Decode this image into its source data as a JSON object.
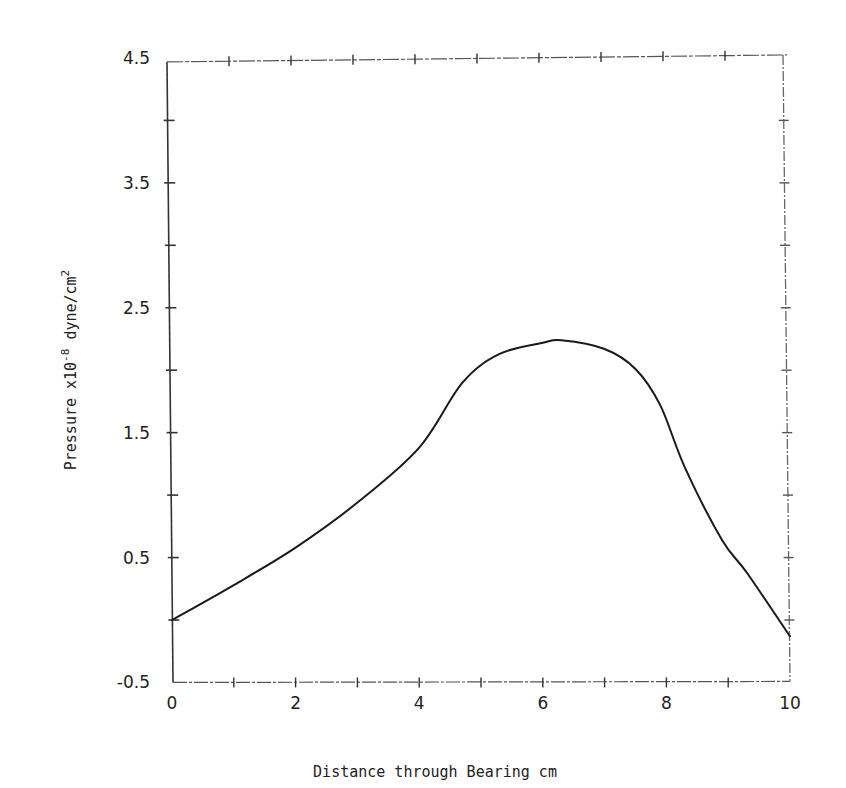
{
  "chart_data": {
    "type": "line",
    "title": "",
    "xlabel": "Distance through Bearing cm",
    "ylabel": "Pressure x10",
    "ylabel_exp": "-8",
    "ylabel_unit": " dyne/cm",
    "ylabel_unit_exp": "2",
    "xlim": [
      0,
      10
    ],
    "ylim": [
      -0.5,
      4.5
    ],
    "grid": false,
    "legend": null,
    "x_ticks": [
      0,
      2,
      4,
      6,
      8,
      10
    ],
    "x_tick_labels": [
      "0",
      "2",
      "4",
      "6",
      "8",
      "10"
    ],
    "x_minor_ticks": [
      1,
      3,
      5,
      7,
      9
    ],
    "y_ticks": [
      -0.5,
      0.5,
      1.5,
      2.5,
      3.5,
      4.5
    ],
    "y_tick_labels": [
      "-0.5",
      "0.5",
      "1.5",
      "2.5",
      "3.5",
      "4.5"
    ],
    "y_minor_ticks": [
      0,
      1,
      2,
      3,
      4
    ],
    "series": [
      {
        "name": "Pressure",
        "color": "#1a1a1a",
        "x": [
          0,
          1,
          2,
          3,
          4,
          4.7,
          5.3,
          6,
          6.3,
          7,
          7.5,
          7.9,
          8.3,
          8.9,
          9.3,
          10
        ],
        "values": [
          0.0,
          0.28,
          0.58,
          0.94,
          1.38,
          1.9,
          2.13,
          2.22,
          2.24,
          2.17,
          2.01,
          1.72,
          1.22,
          0.64,
          0.38,
          -0.13
        ]
      }
    ]
  }
}
